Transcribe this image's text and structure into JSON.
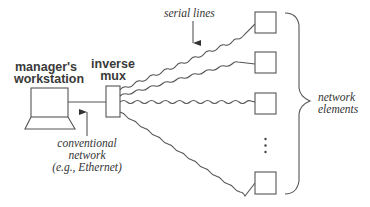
{
  "diagram": {
    "labels": {
      "workstation_line1": "manager's",
      "workstation_line2": "workstation",
      "mux_line1": "inverse",
      "mux_line2": "mux",
      "serial_lines": "serial lines",
      "network_line1": "conventional",
      "network_line2": "network",
      "network_line3": "(e.g., Ethernet)",
      "elements_line1": "network",
      "elements_line2": "elements",
      "ellipsis": "⋮"
    },
    "nodes": [
      {
        "id": "workstation",
        "type": "laptop-icon",
        "label": "manager's workstation"
      },
      {
        "id": "inverse-mux",
        "type": "box",
        "label": "inverse mux"
      },
      {
        "id": "element-1",
        "type": "box"
      },
      {
        "id": "element-2",
        "type": "box"
      },
      {
        "id": "element-3",
        "type": "box"
      },
      {
        "id": "element-n",
        "type": "box"
      }
    ],
    "edges": [
      {
        "from": "workstation",
        "to": "inverse-mux",
        "style": "straight",
        "label": "conventional network (e.g., Ethernet)"
      },
      {
        "from": "inverse-mux",
        "to": "element-1",
        "style": "wavy",
        "label": "serial lines"
      },
      {
        "from": "inverse-mux",
        "to": "element-2",
        "style": "wavy"
      },
      {
        "from": "inverse-mux",
        "to": "element-3",
        "style": "wavy"
      },
      {
        "from": "inverse-mux",
        "to": "element-n",
        "style": "wavy"
      }
    ],
    "colors": {
      "stroke": "#555555",
      "text": "#333333",
      "background": "#ffffff"
    }
  }
}
